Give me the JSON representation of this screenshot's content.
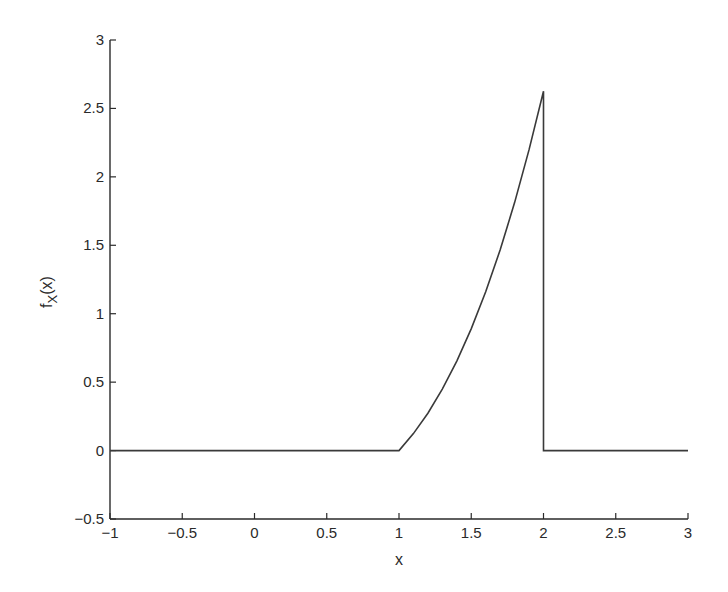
{
  "chart_data": {
    "type": "line",
    "title": "",
    "xlabel": "x",
    "ylabel": "f_X(x)",
    "ylabel_main": "f",
    "ylabel_sub": "X",
    "ylabel_tail": "(x)",
    "xlim": [
      -1,
      3
    ],
    "ylim": [
      -0.5,
      3
    ],
    "grid": false,
    "legend": null,
    "x_ticks": [
      -1,
      -0.5,
      0,
      0.5,
      1,
      1.5,
      2,
      2.5,
      3
    ],
    "x_tick_labels": [
      "−1",
      "−0.5",
      "0",
      "0.5",
      "1",
      "1.5",
      "2",
      "2.5",
      "3"
    ],
    "y_ticks": [
      -0.5,
      0,
      0.5,
      1,
      1.5,
      2,
      2.5,
      3
    ],
    "y_tick_labels": [
      "−0.5",
      "0",
      "0.5",
      "1",
      "1.5",
      "2",
      "2.5",
      "3"
    ],
    "series": [
      {
        "name": "f_X(x)",
        "description": "Piecewise density: 0 for x<1, (3/8)(x^3-1) for 1<=x<=2, 0 for x>2",
        "x": [
          -1,
          1,
          1.1,
          1.2,
          1.3,
          1.4,
          1.5,
          1.6,
          1.7,
          1.8,
          1.9,
          2,
          2,
          3
        ],
        "y": [
          0,
          0,
          0.124,
          0.273,
          0.449,
          0.654,
          0.891,
          1.161,
          1.467,
          1.812,
          2.197,
          2.625,
          0,
          0
        ],
        "color": "#3a3a3a"
      }
    ]
  },
  "colors": {
    "axis": "#2a2a2a",
    "line": "#3a3a3a",
    "background": "#ffffff"
  }
}
